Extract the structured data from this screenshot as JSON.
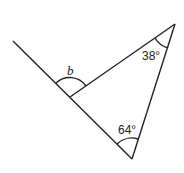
{
  "diagram": {
    "type": "geometry-triangle-exterior-angle",
    "labels": {
      "exterior_angle": "b",
      "top_angle": "38°",
      "bottom_angle": "64°"
    },
    "colors": {
      "stroke": "#222222",
      "background": "#ffffff"
    }
  }
}
